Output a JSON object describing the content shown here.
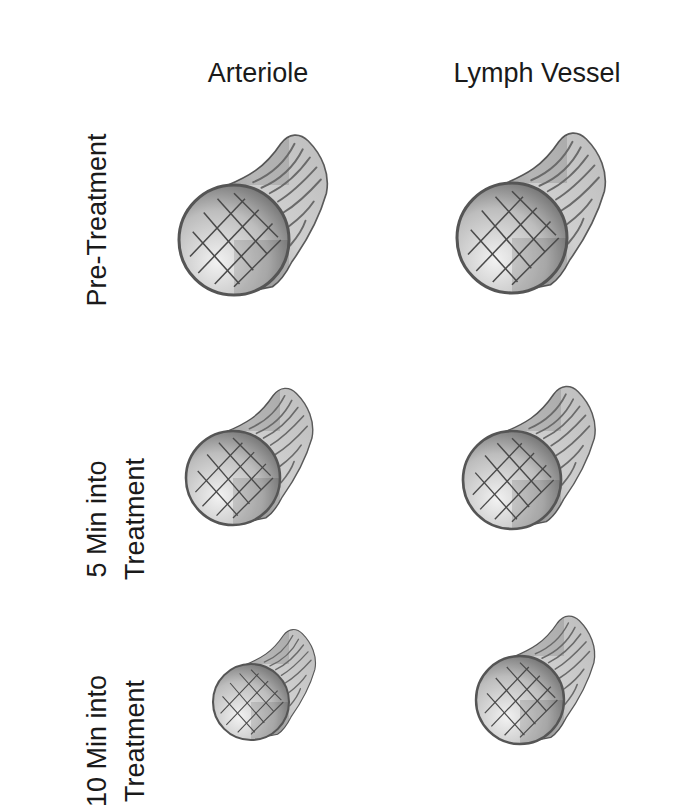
{
  "columns": [
    {
      "label": "Arteriole",
      "x": 258
    },
    {
      "label": "Lymph Vessel",
      "x": 537
    }
  ],
  "rows": [
    {
      "line1": "Pre-Treatment",
      "line2": "",
      "cy": 220
    },
    {
      "line1": "5 Min into",
      "line2": "Treatment",
      "cy": 470
    },
    {
      "line1": "10 Min into",
      "line2": "Treatment",
      "cy": 692
    }
  ],
  "vessels": [
    {
      "row": "Pre-Treatment",
      "type": "Arteriole",
      "cx": 234,
      "cy": 240,
      "r": 55
    },
    {
      "row": "Pre-Treatment",
      "type": "Lymph Vessel",
      "cx": 512,
      "cy": 238,
      "r": 55
    },
    {
      "row": "5 Min into Treatment",
      "type": "Arteriole",
      "cx": 233,
      "cy": 478,
      "r": 47
    },
    {
      "row": "5 Min into Treatment",
      "type": "Lymph Vessel",
      "cx": 512,
      "cy": 480,
      "r": 49
    },
    {
      "row": "10 Min into Treatment",
      "type": "Arteriole",
      "cx": 251,
      "cy": 702,
      "r": 38
    },
    {
      "row": "10 Min into Treatment",
      "type": "Lymph Vessel",
      "cx": 520,
      "cy": 700,
      "r": 44
    }
  ],
  "colors": {
    "outline": "#555555",
    "tube_fill": "#c8c8c8",
    "lumen_light": "#eeeeee",
    "lumen_dark": "#6e6e6e",
    "grid": "#4a4a4a"
  }
}
